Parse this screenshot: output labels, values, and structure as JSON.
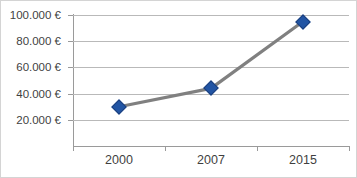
{
  "chart_data": {
    "type": "line",
    "title": "",
    "subtitle": "",
    "xlabel": "",
    "ylabel": "",
    "categories": [
      "2000",
      "2007",
      "2015"
    ],
    "values": [
      30000,
      44000,
      95000
    ],
    "series": [
      {
        "name": "",
        "values": [
          30000,
          44000,
          95000
        ]
      }
    ],
    "ylim": [
      0,
      110000
    ],
    "y_ticks": [
      20000,
      40000,
      60000,
      80000,
      100000
    ],
    "y_tick_labels": [
      "20.000 €",
      "40.000 €",
      "60.000 €",
      "80.000 €",
      "100.000 €"
    ],
    "x_tick_labels": [
      "2000",
      "2007",
      "2015"
    ],
    "grid": true,
    "legend": false,
    "legend_position": "none",
    "marker_shape": "diamond",
    "annotations": []
  },
  "colors": {
    "marker": "#2255a4",
    "marker_border": "#1b3f7d",
    "line": "#808080",
    "gridline": "#b9b9b9",
    "axis": "#9a9a9a",
    "text": "#3f3f3f",
    "background": "#ffffff",
    "frame_border": "#d4d4d4"
  },
  "title_fragment": ""
}
